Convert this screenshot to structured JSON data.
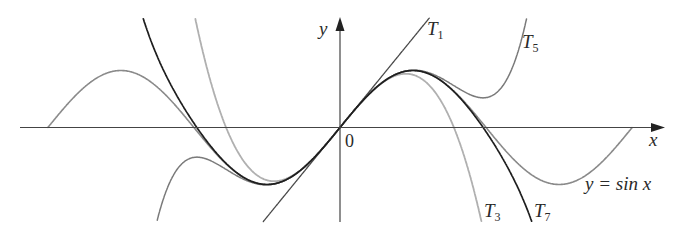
{
  "chart_data": {
    "type": "line",
    "title": "",
    "xlabel": "x",
    "ylabel": "y",
    "origin_label": "0",
    "xlim": [
      -6.9,
      6.9
    ],
    "ylim": [
      -1.7,
      1.9
    ],
    "grid": false,
    "legend": "inline labels",
    "series": [
      {
        "name": "y = sin x",
        "key": "sin",
        "formula": "sin(x)",
        "domain": [
          -6.28,
          6.28
        ],
        "color": "#8a8a8a",
        "width": 1.6,
        "label": "y = sin x"
      },
      {
        "name": "T1",
        "key": "T1",
        "formula": "x",
        "color": "#4a4a4a",
        "width": 1.3,
        "label": "T",
        "sub": "1"
      },
      {
        "name": "T3",
        "key": "T3",
        "formula": "x - x^3/6",
        "color": "#b0b0b0",
        "width": 1.8,
        "label": "T",
        "sub": "3"
      },
      {
        "name": "T5",
        "key": "T5",
        "formula": "x - x^3/6 + x^5/120",
        "color": "#7a7a7a",
        "width": 1.5,
        "label": "T",
        "sub": "5"
      },
      {
        "name": "T7",
        "key": "T7",
        "formula": "x - x^3/6 + x^5/120 - x^7/5040",
        "color": "#1e1e1e",
        "width": 1.7,
        "label": "T",
        "sub": "7"
      }
    ],
    "sample_points": {
      "x": [
        -6.28,
        -4.71,
        -3.14,
        -1.57,
        0,
        1.57,
        3.14,
        4.71,
        6.28
      ],
      "sin": [
        0,
        1,
        0,
        -1,
        0,
        1,
        0,
        -1,
        0
      ]
    }
  },
  "labels": {
    "y_axis": "y",
    "x_axis": "x",
    "origin": "0",
    "T1": {
      "main": "T",
      "sub": "1"
    },
    "T3": {
      "main": "T",
      "sub": "3"
    },
    "T5": {
      "main": "T",
      "sub": "5"
    },
    "T7": {
      "main": "T",
      "sub": "7"
    },
    "sin": "y = sin x"
  }
}
